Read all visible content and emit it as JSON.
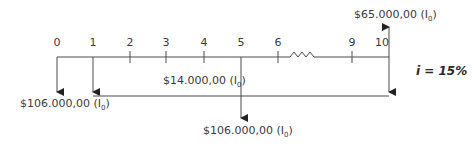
{
  "diagram": {
    "type": "cash-flow-timeline",
    "periods": [
      {
        "label": "0",
        "x": 57
      },
      {
        "label": "1",
        "x": 93
      },
      {
        "label": "2",
        "x": 130
      },
      {
        "label": "3",
        "x": 166
      },
      {
        "label": "4",
        "x": 204
      },
      {
        "label": "5",
        "x": 241
      },
      {
        "label": "6",
        "x": 278
      },
      {
        "label": "9",
        "x": 352
      },
      {
        "label": "10",
        "x": 389
      }
    ],
    "interest_rate": "i = 15%",
    "cash_flows": [
      {
        "period": "0",
        "direction": "down",
        "amount": "$106.000,00",
        "unit": "(I",
        "unit_sub": "0",
        "unit_close": ")"
      },
      {
        "period": "1-10",
        "direction": "down",
        "type": "annuity",
        "amount": "$14.000,00",
        "unit": "(I",
        "unit_sub": "0",
        "unit_close": ")"
      },
      {
        "period": "5",
        "direction": "down",
        "amount": "$106.000,00",
        "unit": "(I",
        "unit_sub": "0",
        "unit_close": ")"
      },
      {
        "period": "10",
        "direction": "up",
        "amount": "$65.000,00",
        "unit": "(I",
        "unit_sub": "0",
        "unit_close": ")"
      }
    ],
    "colors": {
      "line": "#4a4a4a",
      "text": "#3a3a3a"
    }
  }
}
